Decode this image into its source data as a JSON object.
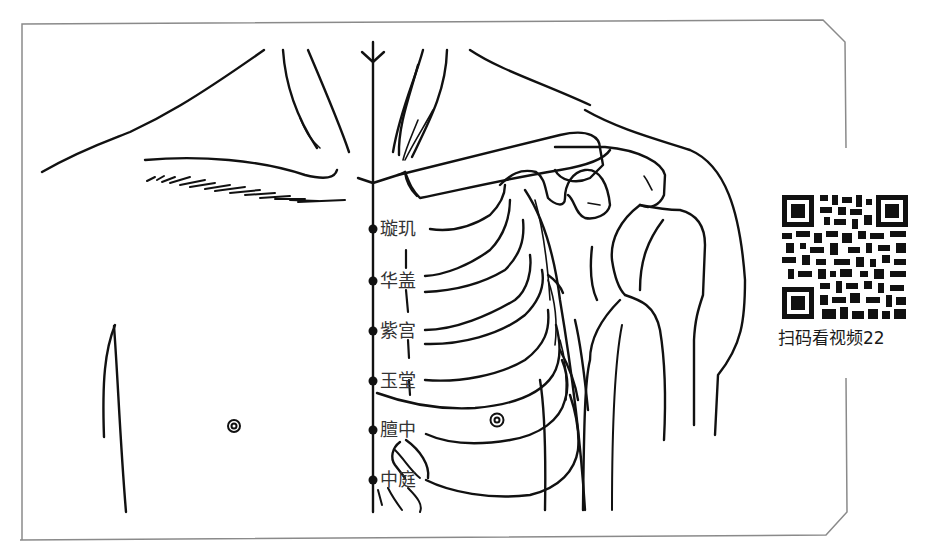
{
  "figure": {
    "type": "acupuncture-point-chart",
    "region": "chest / conception vessel (Ren meridian)",
    "frame_color": "#888888",
    "line_color": "#111111"
  },
  "acupoints": [
    {
      "name": "璇玑",
      "x": 374,
      "y": 229
    },
    {
      "name": "华盖",
      "x": 374,
      "y": 281
    },
    {
      "name": "紫宫",
      "x": 374,
      "y": 331
    },
    {
      "name": "玉堂",
      "x": 374,
      "y": 381
    },
    {
      "name": "膻中",
      "x": 374,
      "y": 430
    },
    {
      "name": "中庭",
      "x": 374,
      "y": 480
    }
  ],
  "qr": {
    "caption": "扫码看视频22"
  }
}
